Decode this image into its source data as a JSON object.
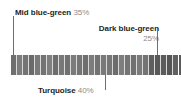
{
  "figure": {
    "type": "color-proportion-strip",
    "background": "#ffffff"
  },
  "callouts": [
    {
      "id": "mid-blue-green",
      "name": "Mid blue-green",
      "percent": "35%",
      "position": "top-left",
      "leader_x": 13
    },
    {
      "id": "dark-blue-green",
      "name": "Dark blue-green",
      "percent": "25%",
      "position": "top-right",
      "leader_x": 157
    },
    {
      "id": "turquoise",
      "name": "Turquoise",
      "percent": "40%",
      "position": "bottom-center",
      "leader_x": 105
    }
  ],
  "chart_data": {
    "type": "bar",
    "title": "",
    "xlabel": "",
    "ylabel": "",
    "categories": [
      "Turquoise",
      "Mid blue-green",
      "Dark blue-green"
    ],
    "values": [
      40,
      35,
      25
    ],
    "value_labels": [
      "40%",
      "35%",
      "25%"
    ],
    "legend": [
      "Mid blue-green 35%",
      "Dark blue-green 25%",
      "Turquoise 40%"
    ],
    "strip": {
      "gap_color": "#d8d8d8",
      "gap_width": 1,
      "bar_width": 5,
      "bar_colors": [
        "#6f6f6f",
        "#7d7d7d",
        "#747474",
        "#6b6b6b",
        "#7a7a7a",
        "#737373",
        "#7f7f7f",
        "#6d6d6d",
        "#787878",
        "#717171",
        "#7b7b7b",
        "#757575",
        "#6e6e6e",
        "#7c7c7c",
        "#727272",
        "#797979",
        "#767676",
        "#6c6c6c",
        "#7e7e7e",
        "#747474",
        "#707070",
        "#7a7a7a",
        "#737373",
        "#5e5e5e",
        "#585858",
        "#5b5b5b",
        "#555555",
        "#606060",
        "#5a5a5a",
        "#5d5d5d",
        "#777777",
        "#6a6a6a"
      ]
    }
  }
}
